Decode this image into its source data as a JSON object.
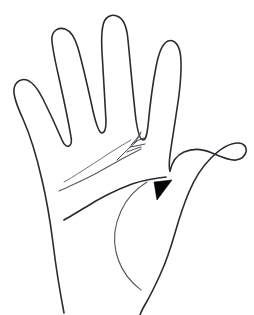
{
  "figure": {
    "alt_text": "Black and white line drawing of an open right hand, palm facing viewer, with palm creases and a solid black arrowhead pointing at the base of the index finger",
    "background_color": "#ffffff",
    "stroke_color": "#2b2b33",
    "marker_color": "#050508",
    "width": 254,
    "height": 315
  },
  "parts": {
    "hand_outline": "hand-outline",
    "pinky_finger": "pinky-finger",
    "ring_finger": "ring-finger",
    "middle_finger": "middle-finger",
    "index_finger": "index-finger",
    "thumb": "thumb",
    "thenar_eminence": "thenar-eminence",
    "wrist": "wrist-edge"
  },
  "palm_lines": {
    "heart_line": "heart-line",
    "head_line": "head-line",
    "life_line": "life-line",
    "branch_fork": "heart-line-fork"
  },
  "annotation": {
    "marker_type": "arrowhead",
    "marker_direction": "up-right",
    "marker_x": 164,
    "marker_y": 190,
    "points_at": "index-finger-base"
  }
}
